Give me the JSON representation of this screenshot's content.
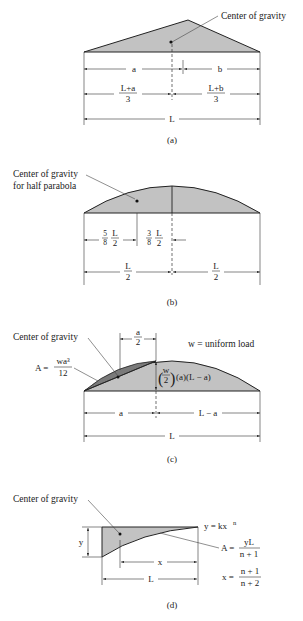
{
  "colors": {
    "fill": "#c2c2c2",
    "dark_fill": "#7a7a7a",
    "line": "#222222",
    "background": "#ffffff"
  },
  "panel_a": {
    "caption": "(a)",
    "cg_label": "Center of gravity",
    "dim_a": "a",
    "dim_b": "b",
    "dim_left_num": "L+a",
    "dim_left_den": "3",
    "dim_right_num": "L+b",
    "dim_right_den": "3",
    "dim_total": "L"
  },
  "panel_b": {
    "caption": "(b)",
    "cg_label_line1": "Center of gravity",
    "cg_label_line2": "for half parabola",
    "frac1_coef_num": "5",
    "frac1_coef_den": "8",
    "frac1_num": "L",
    "frac1_den": "2",
    "frac2_coef_num": "3",
    "frac2_coef_den": "8",
    "frac2_num": "L",
    "frac2_den": "2",
    "half_left_num": "L",
    "half_left_den": "2",
    "half_right_num": "L",
    "half_right_den": "2"
  },
  "panel_c": {
    "caption": "(c)",
    "cg_label": "Center of gravity",
    "area_label": "A =",
    "area_num": "wa³",
    "area_den": "12",
    "half_a_num": "a",
    "half_a_den": "2",
    "load_label": "w = uniform load",
    "height_w": "w",
    "height_2": "2",
    "height_rest": "(a)(L − a)",
    "dim_a": "a",
    "dim_la": "L − a",
    "dim_total": "L"
  },
  "panel_d": {
    "caption": "(d)",
    "cg_label": "Center of gravity",
    "curve_label": "y = kx",
    "curve_exp": "n",
    "dim_y": "y",
    "dim_x": "x",
    "dim_total": "L",
    "area_label": "A =",
    "area_num": "yL",
    "area_den": "n + 1",
    "x_label": "x =",
    "x_num": "n + 1",
    "x_den": "n + 2"
  }
}
